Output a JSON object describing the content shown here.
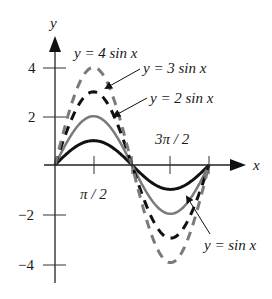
{
  "chart_data": {
    "type": "line",
    "title": "",
    "xlabel": "x",
    "ylabel": "y",
    "xlim": [
      0,
      6.2832
    ],
    "ylim": [
      -4.5,
      5
    ],
    "grid": false,
    "x_ticks": [
      {
        "value": 1.5708,
        "label": "π / 2"
      },
      {
        "value": 3.1416,
        "label": ""
      },
      {
        "value": 4.7124,
        "label": "3π / 2"
      },
      {
        "value": 6.2832,
        "label": ""
      }
    ],
    "y_ticks": [
      {
        "value": 4,
        "label": "4"
      },
      {
        "value": 2,
        "label": "2"
      },
      {
        "value": -2,
        "label": "−2"
      },
      {
        "value": -4,
        "label": "−4"
      }
    ],
    "series": [
      {
        "name": "y = sin x",
        "amplitude": 1,
        "style": "solid",
        "color": "#111111",
        "width": 3,
        "x": [
          0,
          0.7854,
          1.5708,
          2.3562,
          3.1416,
          3.927,
          4.7124,
          5.4978,
          6.2832
        ],
        "values": [
          0,
          0.71,
          1,
          0.71,
          0,
          -0.71,
          -1,
          -0.71,
          0
        ]
      },
      {
        "name": "y = 2 sin x",
        "amplitude": 2,
        "style": "solid",
        "color": "#7a7a7a",
        "width": 2.5,
        "x": [
          0,
          0.7854,
          1.5708,
          2.3562,
          3.1416,
          3.927,
          4.7124,
          5.4978,
          6.2832
        ],
        "values": [
          0,
          1.41,
          2,
          1.41,
          0,
          -1.41,
          -2,
          -1.41,
          0
        ]
      },
      {
        "name": "y = 3 sin x",
        "amplitude": 3,
        "style": "dashed",
        "color": "#111111",
        "width": 3,
        "x": [
          0,
          0.7854,
          1.5708,
          2.3562,
          3.1416,
          3.927,
          4.7124,
          5.4978,
          6.2832
        ],
        "values": [
          0,
          2.12,
          3,
          2.12,
          0,
          -2.12,
          -3,
          -2.12,
          0
        ]
      },
      {
        "name": "y = 4 sin x",
        "amplitude": 4,
        "style": "dashed",
        "color": "#7a7a7a",
        "width": 3,
        "x": [
          0,
          0.7854,
          1.5708,
          2.3562,
          3.1416,
          3.927,
          4.7124,
          5.4978,
          6.2832
        ],
        "values": [
          0,
          2.83,
          4,
          2.83,
          0,
          -2.83,
          -4,
          -2.83,
          0
        ]
      }
    ],
    "annotations": [
      {
        "text": "y = 4 sin x",
        "x": 74,
        "y": 57,
        "arrow": false
      },
      {
        "text": "y = 3 sin x",
        "x": 143,
        "y": 72,
        "arrow": true,
        "arrow_to": [
          104,
          89
        ]
      },
      {
        "text": "y = 2 sin x",
        "x": 150,
        "y": 102,
        "arrow": true,
        "arrow_to": [
          112,
          117
        ]
      },
      {
        "text": "y = sin x",
        "x": 206,
        "y": 249,
        "arrow": true,
        "arrow_to": [
          185,
          195
        ]
      }
    ],
    "legend": "none (curves labeled directly with annotations)"
  },
  "labels": {
    "y_axis": "y",
    "x_axis": "x",
    "tick_pi_half": "π / 2",
    "tick_three_pi_half": "3π / 2",
    "tick_4": "4",
    "tick_2": "2",
    "tick_m2": "−2",
    "tick_m4": "−4",
    "ann_4sin": "y = 4 sin x",
    "ann_3sin": "y = 3 sin x",
    "ann_2sin": "y = 2 sin x",
    "ann_sin": "y = sin x"
  }
}
